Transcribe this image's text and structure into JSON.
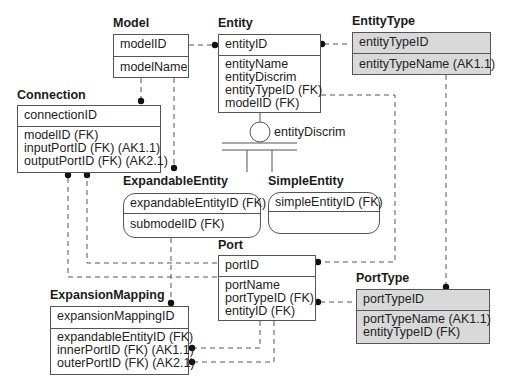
{
  "diagram": {
    "entities": {
      "model": {
        "title": "Model",
        "key": "modelID",
        "attributes": [
          "modelName"
        ],
        "style": "independent"
      },
      "entity": {
        "title": "Entity",
        "key": "entityID",
        "attributes": [
          "entityName",
          "entityDiscrim",
          "entityTypeID (FK)",
          "modelID (FK)"
        ],
        "style": "independent"
      },
      "entityType": {
        "title": "EntityType",
        "key": "entityTypeID",
        "attributes": [
          "entityTypeName (AK1.1)"
        ],
        "style": "shaded"
      },
      "connection": {
        "title": "Connection",
        "key": "connectionID",
        "attributes": [
          "modelID (FK)",
          "inputPortID (FK) (AK1.1)",
          "outputPortID (FK) (AK2.1)"
        ],
        "style": "independent"
      },
      "expandableEntity": {
        "title": "ExpandableEntity",
        "key": "expandableEntityID (FK)",
        "attributes": [
          "submodelID (FK)"
        ],
        "style": "dependent"
      },
      "simpleEntity": {
        "title": "SimpleEntity",
        "key": "simpleEntityID (FK)",
        "attributes": [],
        "style": "dependent"
      },
      "port": {
        "title": "Port",
        "key": "portID",
        "attributes": [
          "portName",
          "portTypeID (FK)",
          "entityID (FK)"
        ],
        "style": "independent"
      },
      "portType": {
        "title": "PortType",
        "key": "portTypeID",
        "attributes": [
          "portTypeName (AK1.1)",
          "entityTypeID (FK)"
        ],
        "style": "shaded"
      },
      "expansionMapping": {
        "title": "ExpansionMapping",
        "key": "expansionMappingID",
        "attributes": [
          "expandableEntityID (FK)",
          "innerPortID (FK) (AK1.1)",
          "outerPortID (FK) (AK2.1)"
        ],
        "style": "independent"
      }
    },
    "discriminator": {
      "label": "entityDiscrim",
      "parent": "Entity",
      "subtypes": [
        "ExpandableEntity",
        "SimpleEntity"
      ]
    },
    "relationships": [
      {
        "from": "Model",
        "to": "Entity",
        "style": "dashed"
      },
      {
        "from": "EntityType",
        "to": "Entity",
        "style": "dashed"
      },
      {
        "from": "Model",
        "to": "Connection",
        "style": "dashed"
      },
      {
        "from": "Model",
        "to": "ExpandableEntity",
        "style": "dashed"
      },
      {
        "from": "Entity",
        "to": "Port",
        "style": "dashed"
      },
      {
        "from": "EntityType",
        "to": "PortType",
        "style": "dashed"
      },
      {
        "from": "PortType",
        "to": "Port",
        "style": "dashed"
      },
      {
        "from": "Port",
        "to": "Connection",
        "label": "input",
        "style": "dashed"
      },
      {
        "from": "Port",
        "to": "Connection",
        "label": "output",
        "style": "dashed"
      },
      {
        "from": "ExpandableEntity",
        "to": "ExpansionMapping",
        "style": "dashed"
      },
      {
        "from": "Port",
        "to": "ExpansionMapping",
        "label": "inner",
        "style": "dashed"
      },
      {
        "from": "Port",
        "to": "ExpansionMapping",
        "label": "outer",
        "style": "dashed"
      }
    ],
    "colors": {
      "line": "#555555",
      "shaded_fill": "#d9d9d9",
      "background": "#ffffff"
    }
  }
}
